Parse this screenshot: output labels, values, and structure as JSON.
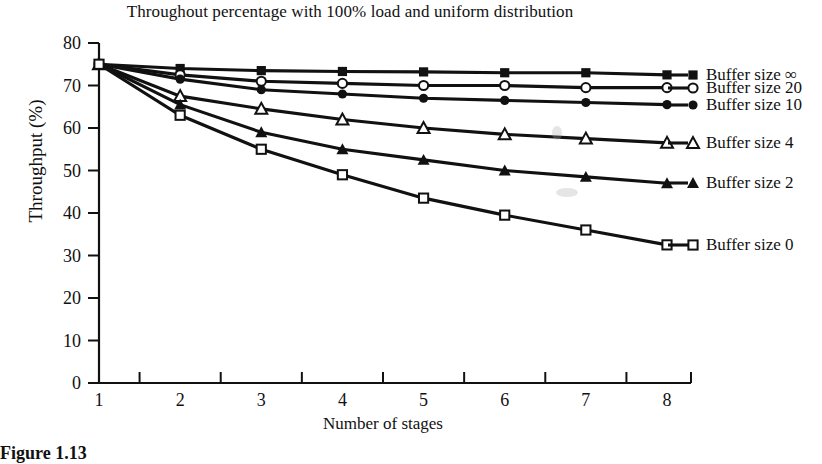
{
  "chart_data": {
    "type": "line",
    "title": "Throughout percentage with 100% load and uniform distribution",
    "xlabel": "Number of stages",
    "ylabel": "Throughput (%)",
    "x": [
      1,
      2,
      3,
      4,
      5,
      6,
      7,
      8
    ],
    "xlim": [
      1,
      8
    ],
    "ylim": [
      0,
      80
    ],
    "xticks": [
      "1",
      "2",
      "3",
      "4",
      "5",
      "6",
      "7",
      "8"
    ],
    "yticks": [
      "0",
      "10",
      "20",
      "30",
      "40",
      "50",
      "60",
      "70",
      "80"
    ],
    "grid": false,
    "legend_position": "right",
    "series": [
      {
        "name": "Buffer size ∞",
        "marker": "filled-square",
        "values": [
          75,
          74,
          73.5,
          73.3,
          73.2,
          73,
          73,
          72.5
        ]
      },
      {
        "name": "Buffer size 20",
        "marker": "open-circle",
        "values": [
          75,
          72.5,
          71,
          70.5,
          70,
          70,
          69.5,
          69.5
        ]
      },
      {
        "name": "Buffer size 10",
        "marker": "filled-circle",
        "values": [
          75,
          71.5,
          69,
          68,
          67,
          66.5,
          66,
          65.5
        ]
      },
      {
        "name": "Buffer size 4",
        "marker": "open-triangle",
        "values": [
          75,
          67.5,
          64.5,
          62,
          60,
          58.5,
          57.5,
          56.5
        ]
      },
      {
        "name": "Buffer size 2",
        "marker": "filled-triangle",
        "values": [
          75,
          65.5,
          59,
          55,
          52.5,
          50,
          48.5,
          47
        ]
      },
      {
        "name": "Buffer size 0",
        "marker": "open-square",
        "values": [
          75,
          63,
          55,
          49,
          43.5,
          39.5,
          36,
          32.5
        ]
      }
    ]
  },
  "legend": {
    "items": [
      {
        "label": "Buffer size ∞"
      },
      {
        "label": "Buffer size 20"
      },
      {
        "label": "Buffer size 10"
      },
      {
        "label": "Buffer size 4"
      },
      {
        "label": "Buffer size 2"
      },
      {
        "label": "Buffer size 0"
      }
    ]
  },
  "caption": {
    "text": "Figure 1.13"
  },
  "colors": {
    "ink": "#111111",
    "background": "#ffffff"
  }
}
